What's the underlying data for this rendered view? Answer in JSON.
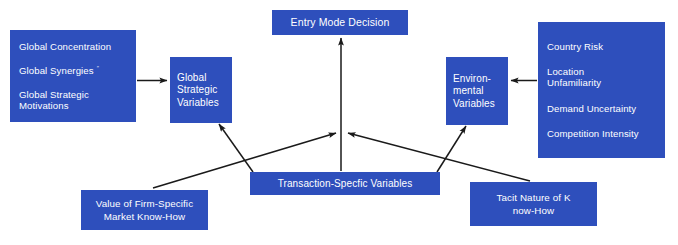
{
  "diagram": {
    "box_color": "#2e4fbc",
    "text_color": "#ffffff",
    "arrow_color": "#1a1a1a",
    "background": "#ffffff",
    "nodes": {
      "global_drivers": {
        "name": "global-drivers",
        "lines": [
          "Global Concentration",
          "Global Synergies",
          "Global Strategic",
          "Motivations"
        ],
        "superscript": "″"
      },
      "global_strategic_variables": {
        "name": "global-strategic-variables",
        "lines": [
          "Global",
          "Strategic",
          "Variables"
        ]
      },
      "entry_mode_decision": {
        "name": "entry-mode-decision",
        "lines": [
          "Entry Mode Decision"
        ]
      },
      "environmental_variables": {
        "name": "environmental-variables",
        "lines": [
          "Environ-",
          "mental",
          "Variables"
        ]
      },
      "environmental_drivers": {
        "name": "environmental-drivers",
        "lines": [
          "Country Risk",
          "Location",
          "Unfamiliarity",
          "Demand Uncertainty",
          "Competition Intensity"
        ]
      },
      "firm_specific_know_how": {
        "name": "firm-specific-know-how",
        "lines": [
          "Value of Firm-Specific",
          "Market Know-How"
        ]
      },
      "transaction_specific_variables": {
        "name": "transaction-specific-variables",
        "lines": [
          "Transaction-Specfic Variables"
        ]
      },
      "tacit_nature": {
        "name": "tacit-nature-of-know-how",
        "lines": [
          "Tacit Nature of K",
          "now-How"
        ]
      }
    },
    "edges": [
      {
        "from": "global_drivers",
        "to": "global_strategic_variables",
        "direction": "right"
      },
      {
        "from": "environmental_drivers",
        "to": "environmental_variables",
        "direction": "left"
      },
      {
        "from": "transaction_specific_variables",
        "to": "entry_mode_decision",
        "direction": "up"
      },
      {
        "from": "transaction_specific_variables",
        "to": "global_strategic_variables",
        "direction": "up-left"
      },
      {
        "from": "transaction_specific_variables",
        "to": "environmental_variables",
        "direction": "up-right"
      },
      {
        "from": "firm_specific_know_how",
        "to": "entry_mode_decision",
        "direction": "up-right"
      },
      {
        "from": "tacit_nature",
        "to": "entry_mode_decision",
        "direction": "up-left"
      }
    ]
  }
}
